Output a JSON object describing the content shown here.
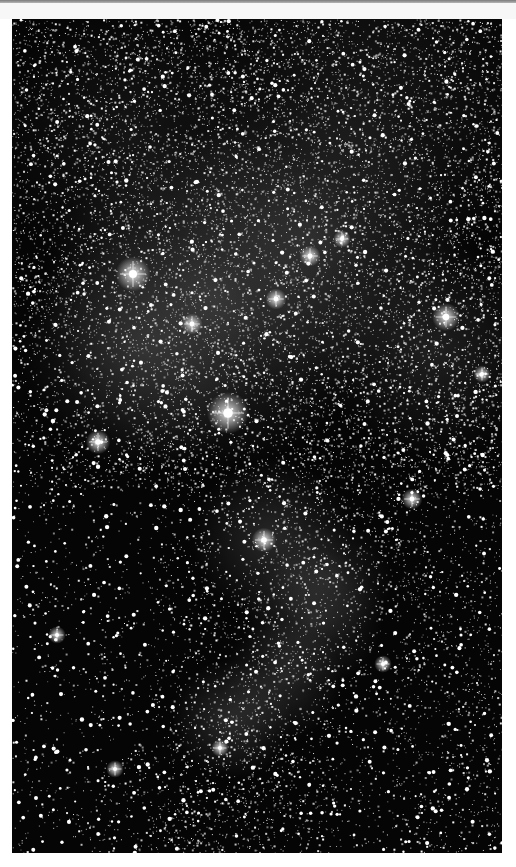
{
  "image": {
    "subject": "Astrophotography of a dense star field with glowing nebulosity",
    "color_mode": "grayscale",
    "alt_text": "Grayscale star field with bright nebula clouds",
    "colors": {
      "sky": "#050505",
      "star": "#ffffff",
      "nebula": "#b4b4b4",
      "page_background": "#ffffff",
      "top_bar": "#8a8a8a"
    }
  }
}
